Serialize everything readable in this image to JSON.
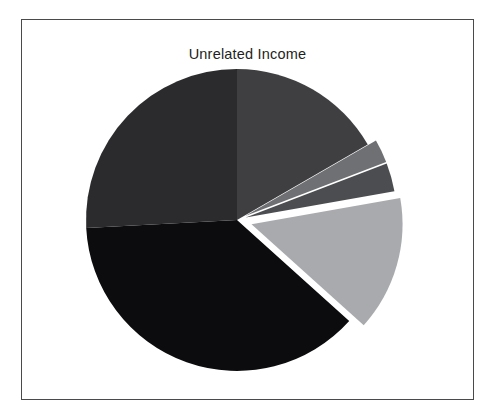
{
  "figure": {
    "background_color": "#ffffff",
    "frame_color": "#4a4a4d"
  },
  "chart_data": {
    "type": "pie",
    "title": "Unrelated Income",
    "xlabel": "",
    "ylabel": "",
    "legend": "none",
    "grid": false,
    "start_angle_deg": 0,
    "direction": "clockwise",
    "center": {
      "x": 215,
      "y": 200
    },
    "radius": 151,
    "labels": [
      "Slice 1",
      "Slice 2",
      "Slice 3",
      "Slice 4",
      "Slice 5",
      "Slice 6"
    ],
    "values": [
      16.7,
      2.5,
      3.1,
      14.4,
      37.5,
      25.8
    ],
    "percentages": [
      "16.7%",
      "2.5%",
      "3.1%",
      "14.4%",
      "37.5%",
      "25.8%"
    ],
    "angles_deg": [
      60,
      9,
      11,
      52,
      135,
      93
    ],
    "colors": [
      "#3f3f42",
      "#6f7073",
      "#4c4d50",
      "#a9aaad",
      "#0c0c0e",
      "#2b2b2e"
    ],
    "explode": [
      0,
      0.06,
      0.06,
      0.1,
      0,
      0
    ],
    "slices": [
      {
        "label": "Slice 1",
        "value": 16.7,
        "angle_deg": 60,
        "color": "#3f3f42",
        "exploded": false
      },
      {
        "label": "Slice 2",
        "value": 2.5,
        "angle_deg": 9,
        "color": "#6f7073",
        "exploded": true
      },
      {
        "label": "Slice 3",
        "value": 3.1,
        "angle_deg": 11,
        "color": "#4c4d50",
        "exploded": true
      },
      {
        "label": "Slice 4",
        "value": 14.4,
        "angle_deg": 52,
        "color": "#a9aaad",
        "exploded": true
      },
      {
        "label": "Slice 5",
        "value": 37.5,
        "angle_deg": 135,
        "color": "#0c0c0e",
        "exploded": false
      },
      {
        "label": "Slice 6",
        "value": 25.8,
        "angle_deg": 93,
        "color": "#2b2b2e",
        "exploded": false
      }
    ]
  }
}
